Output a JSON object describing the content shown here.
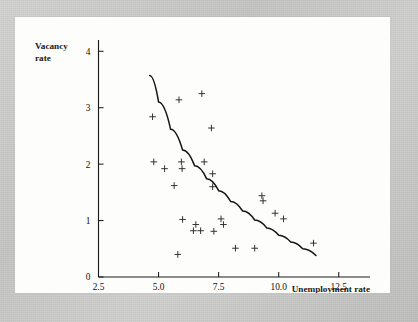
{
  "figure": {
    "background_color": "#fdfdfc",
    "page_color": "#c9c9c7",
    "ink_color": "#141414"
  },
  "chart_data": {
    "type": "scatter",
    "title": "",
    "subtitle": "",
    "xlabel": "Unemployment rate",
    "ylabel": "Vacancy rate",
    "ylabel_lines": [
      "Vacancy",
      "rate"
    ],
    "xlim": [
      2.5,
      13.8
    ],
    "ylim": [
      0,
      4.2
    ],
    "xticks": [
      2.5,
      5.0,
      7.5,
      10.0,
      12.5
    ],
    "xtick_labels": [
      "2.5",
      "5.0",
      "7.5",
      "10.0",
      "12.5"
    ],
    "yticks": [
      0,
      1,
      2,
      3,
      4
    ],
    "ytick_labels": [
      "0",
      "1",
      "2",
      "3",
      "4"
    ],
    "grid": false,
    "legend": false,
    "legend_position": "none",
    "marker_symbol": "plus",
    "points": [
      {
        "x": 4.75,
        "y": 2.84
      },
      {
        "x": 4.8,
        "y": 2.04
      },
      {
        "x": 5.25,
        "y": 1.92
      },
      {
        "x": 5.65,
        "y": 1.62
      },
      {
        "x": 5.85,
        "y": 3.14
      },
      {
        "x": 5.95,
        "y": 2.04
      },
      {
        "x": 5.98,
        "y": 1.92
      },
      {
        "x": 6.0,
        "y": 1.02
      },
      {
        "x": 5.8,
        "y": 0.4
      },
      {
        "x": 6.45,
        "y": 0.82
      },
      {
        "x": 6.55,
        "y": 0.93
      },
      {
        "x": 6.75,
        "y": 0.82
      },
      {
        "x": 6.8,
        "y": 3.25
      },
      {
        "x": 6.9,
        "y": 2.04
      },
      {
        "x": 7.2,
        "y": 2.64
      },
      {
        "x": 7.25,
        "y": 1.83
      },
      {
        "x": 7.25,
        "y": 1.6
      },
      {
        "x": 7.3,
        "y": 0.81
      },
      {
        "x": 7.6,
        "y": 1.03
      },
      {
        "x": 7.7,
        "y": 0.93
      },
      {
        "x": 8.2,
        "y": 0.51
      },
      {
        "x": 9.0,
        "y": 0.51
      },
      {
        "x": 9.3,
        "y": 1.44
      },
      {
        "x": 9.35,
        "y": 1.35
      },
      {
        "x": 9.85,
        "y": 1.13
      },
      {
        "x": 10.2,
        "y": 1.03
      },
      {
        "x": 11.45,
        "y": 0.6
      }
    ],
    "fit_curve": {
      "label": "fitted curve",
      "style": "solid",
      "points": [
        {
          "x": 4.63,
          "y": 3.57
        },
        {
          "x": 5.0,
          "y": 3.1
        },
        {
          "x": 5.5,
          "y": 2.62
        },
        {
          "x": 6.0,
          "y": 2.25
        },
        {
          "x": 6.5,
          "y": 1.97
        },
        {
          "x": 7.0,
          "y": 1.74
        },
        {
          "x": 7.5,
          "y": 1.53
        },
        {
          "x": 8.0,
          "y": 1.34
        },
        {
          "x": 8.5,
          "y": 1.17
        },
        {
          "x": 9.0,
          "y": 1.01
        },
        {
          "x": 9.5,
          "y": 0.87
        },
        {
          "x": 10.0,
          "y": 0.74
        },
        {
          "x": 10.5,
          "y": 0.62
        },
        {
          "x": 11.0,
          "y": 0.5
        },
        {
          "x": 11.55,
          "y": 0.38
        }
      ]
    }
  }
}
